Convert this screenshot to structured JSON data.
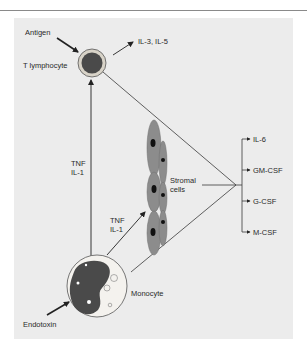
{
  "diagram": {
    "title": "",
    "cells": {
      "t_lymphocyte": "T lymphocyte",
      "monocyte": "Monocyte",
      "stromal": [
        "Stromal",
        "cells"
      ]
    },
    "stimuli": {
      "antigen": "Antigen",
      "endotoxin": "Endotoxin"
    },
    "t_cell_products": "IL-3, IL-5",
    "monocyte_to_t_cell": [
      "TNF",
      "IL-1"
    ],
    "monocyte_to_stromal": [
      "TNF",
      "IL-1"
    ],
    "outputs": [
      "IL-6",
      "GM-CSF",
      "G-CSF",
      "M-CSF"
    ],
    "colors": {
      "panel": "#ececec",
      "line": "#3a3a3a",
      "nucleus": "#4a4a4a",
      "stromal_cell": "#8c8c8c",
      "cell_outline": "#d8d3c8"
    }
  }
}
